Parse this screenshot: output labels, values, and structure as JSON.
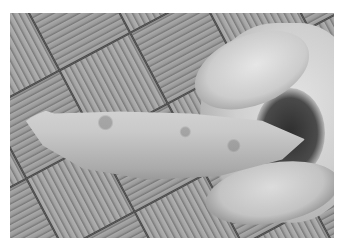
{
  "image": {
    "description": "Black and white photograph of a hand holding a sweet potato over a parquet wooden floor",
    "palette": {
      "border": "#ffffff",
      "floor_light": "#a8a8a8",
      "floor_dark": "#4a4a4a",
      "potato": "#c9c9c9",
      "hand": "#d6d6d6"
    }
  }
}
